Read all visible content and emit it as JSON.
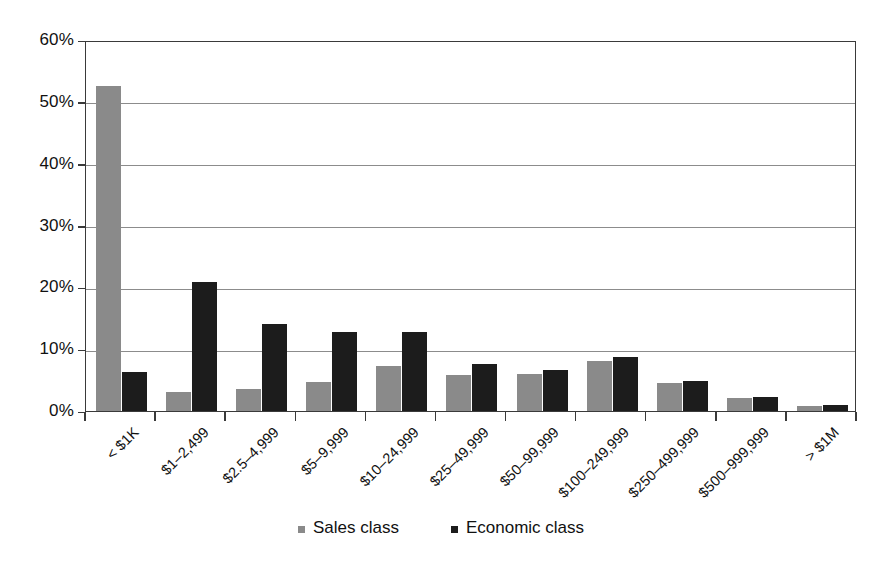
{
  "chart_data": {
    "type": "bar",
    "title": "",
    "subtitle": "",
    "xlabel": "",
    "ylabel": "",
    "ylim": [
      0,
      60
    ],
    "ytick_labels": [
      "0%",
      "10%",
      "20%",
      "30%",
      "40%",
      "50%",
      "60%"
    ],
    "ytick_values": [
      0,
      10,
      20,
      30,
      40,
      50,
      60
    ],
    "grid": true,
    "legend_position": "bottom",
    "value_format": "percent",
    "categories": [
      "< $1K",
      "$1–2,499",
      "$2.5–4,999",
      "$5–9,999",
      "$10–24,999",
      "$25–49,999",
      "$50–99,999",
      "$100–249,999",
      "$250–499,999",
      "$500–999,999",
      "> $1M"
    ],
    "series": [
      {
        "name": "Sales class",
        "color": "#8a8a8a",
        "values": [
          52.5,
          3.0,
          3.5,
          4.7,
          7.3,
          5.8,
          6.0,
          8.1,
          4.5,
          2.1,
          0.8
        ]
      },
      {
        "name": "Economic class",
        "color": "#1c1c1c",
        "values": [
          6.3,
          20.8,
          14.1,
          12.8,
          12.8,
          7.6,
          6.6,
          8.7,
          4.9,
          2.2,
          0.9
        ]
      }
    ]
  },
  "legend": {
    "items": [
      {
        "label": "Sales class",
        "color": "#8a8a8a"
      },
      {
        "label": "Economic class",
        "color": "#1c1c1c"
      }
    ]
  }
}
